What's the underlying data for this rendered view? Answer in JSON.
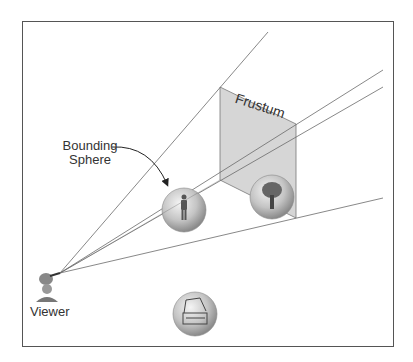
{
  "diagram": {
    "labels": {
      "frustum": "Frustum",
      "bounding_sphere_line1": "Bounding",
      "bounding_sphere_line2": "Sphere",
      "viewer": "Viewer"
    },
    "viewer_position": [
      60,
      273
    ],
    "frustum_rays_endpoints": [
      [
        268,
        32
      ],
      [
        383,
        70
      ],
      [
        383,
        87
      ],
      [
        383,
        198
      ]
    ],
    "frustum_panel": [
      [
        220,
        87
      ],
      [
        296,
        124
      ],
      [
        296,
        218
      ],
      [
        220,
        180
      ]
    ],
    "objects": [
      {
        "name": "person",
        "center": [
          184,
          210
        ],
        "radius": 22,
        "in_frustum": true
      },
      {
        "name": "tree",
        "center": [
          272,
          197
        ],
        "radius": 22,
        "in_frustum": true
      },
      {
        "name": "treasure-chest",
        "center": [
          195,
          314
        ],
        "radius": 22,
        "in_frustum": false
      }
    ],
    "colors": {
      "panel": "#d6d6d6",
      "lines": "#6a6a6a",
      "frame": "#555555",
      "sphere_light": "#f2f2f2",
      "sphere_dark": "#8a8a8a"
    }
  }
}
